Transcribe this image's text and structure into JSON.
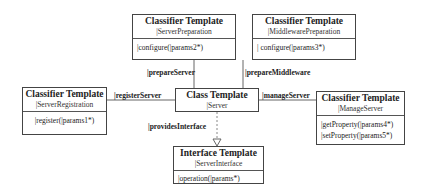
{
  "diagram": {
    "nodes": {
      "server_preparation": {
        "stereotype": "Classifier Template",
        "name": "|ServerPreparation",
        "operations": [
          "|configure(|params2*)"
        ]
      },
      "middleware_preparation": {
        "stereotype": "Classifier Template",
        "name": "|MiddlewarePreparation",
        "operations": [
          "| configure(|params3*)"
        ]
      },
      "server_registration": {
        "stereotype": "Classifier Template",
        "name": "|ServerRegistration",
        "operations": [
          "|register(|params1*)"
        ]
      },
      "server": {
        "stereotype": "Class Template",
        "name": "|Server"
      },
      "manage_server": {
        "stereotype": "Classifier Template",
        "name": "|ManageServer",
        "operations": [
          "|getProperty(|params4*)",
          "|setProperty(|params5*)"
        ]
      },
      "server_interface": {
        "stereotype": "Interface Template",
        "name": "|ServerInterface",
        "operations": [
          "|operation(|params*)"
        ]
      }
    },
    "edges": {
      "prepare_server": "|prepareServer",
      "prepare_middleware": "|prepareMiddleware",
      "register_server": "|registerServer",
      "manage_server": "|manageServer",
      "provides_interface": "|providesInterface"
    },
    "colors": {
      "line": "#444444",
      "text": "#222222",
      "background": "#ffffff"
    }
  }
}
